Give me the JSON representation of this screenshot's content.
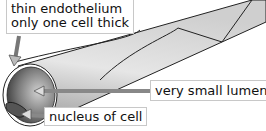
{
  "diagram": {
    "labels": [
      {
        "id": "endothelium",
        "lines": [
          "thin endothelium",
          "only one cell thick"
        ]
      },
      {
        "id": "lumen",
        "text": "very small lumen"
      },
      {
        "id": "nucleus",
        "text": "nucleus of cell"
      }
    ]
  }
}
